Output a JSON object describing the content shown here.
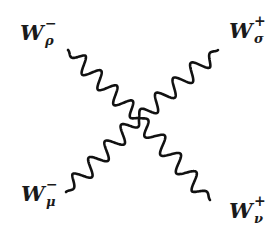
{
  "diagram": {
    "colors": {
      "line": "#111111",
      "text": "#1a1a1a",
      "background": "#ffffff"
    },
    "vertex": {
      "x": 139,
      "y": 118
    },
    "legs": [
      {
        "id": "top-left",
        "symbol": "W",
        "charge": "−",
        "index": "ρ",
        "start": {
          "x": 68,
          "y": 50
        },
        "end": {
          "x": 139,
          "y": 118
        },
        "waves": 4,
        "amplitude": 8
      },
      {
        "id": "top-right",
        "symbol": "W",
        "charge": "+",
        "index": "σ",
        "start": {
          "x": 218,
          "y": 50
        },
        "end": {
          "x": 139,
          "y": 118
        },
        "waves": 4,
        "amplitude": 8
      },
      {
        "id": "bottom-left",
        "symbol": "W",
        "charge": "−",
        "index": "μ",
        "start": {
          "x": 66,
          "y": 192
        },
        "end": {
          "x": 139,
          "y": 118
        },
        "waves": 4,
        "amplitude": 8
      },
      {
        "id": "bottom-right",
        "symbol": "W",
        "charge": "+",
        "index": "ν",
        "start": {
          "x": 210,
          "y": 200
        },
        "end": {
          "x": 139,
          "y": 118
        },
        "waves": 4,
        "amplitude": 8
      }
    ]
  }
}
